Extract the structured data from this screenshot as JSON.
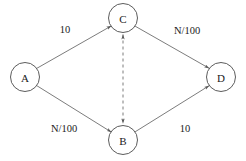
{
  "diagram": {
    "type": "directed-graph",
    "background_color": "#ffffff",
    "stroke_color": "#5a5a5a",
    "text_color": "#1a1a1a",
    "nodes": [
      {
        "id": "A",
        "label": "A",
        "x": 25,
        "y": 77,
        "r": 14.5
      },
      {
        "id": "B",
        "label": "B",
        "x": 123,
        "y": 140,
        "r": 14.5
      },
      {
        "id": "C",
        "label": "C",
        "x": 123,
        "y": 18,
        "r": 14.5
      },
      {
        "id": "D",
        "label": "D",
        "x": 221,
        "y": 77,
        "r": 14.5
      }
    ],
    "edges": [
      {
        "id": "a-c",
        "from": "A",
        "to": "C",
        "label": "10",
        "label_x": 65,
        "label_y": 29,
        "style": "solid",
        "arrow": "forward"
      },
      {
        "id": "c-d",
        "from": "C",
        "to": "D",
        "label": "N/100",
        "label_x": 187,
        "label_y": 30,
        "style": "solid",
        "arrow": "forward"
      },
      {
        "id": "a-b",
        "from": "A",
        "to": "B",
        "label": "N/100",
        "label_x": 64,
        "label_y": 128,
        "style": "solid",
        "arrow": "forward"
      },
      {
        "id": "b-d",
        "from": "B",
        "to": "D",
        "label": "10",
        "label_x": 185,
        "label_y": 128,
        "style": "solid",
        "arrow": "forward"
      },
      {
        "id": "c-b",
        "from": "C",
        "to": "B",
        "label": "",
        "label_x": 0,
        "label_y": 0,
        "style": "dashed",
        "arrow": "both"
      }
    ]
  }
}
